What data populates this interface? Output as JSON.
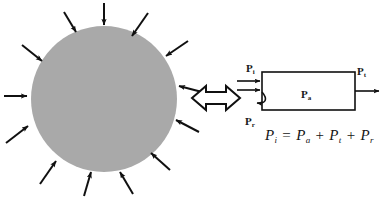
{
  "figure": {
    "background_color": "#ffffff",
    "width": 387,
    "height": 202
  },
  "left_panel": {
    "name": "incident-flux-on-body",
    "body": {
      "shape": "circle",
      "fill_color": "#a9a9a9",
      "center_x": 104,
      "center_y": 99,
      "radius": 73
    },
    "arrow_color": "#101010",
    "arrow_count": 12,
    "arrow_direction": "inward",
    "arrow_angles_deg": [
      90,
      62,
      34,
      10,
      180,
      203,
      230,
      258,
      285,
      310,
      337,
      155
    ]
  },
  "equivalence": {
    "name": "equivalence-arrow",
    "symbol": "⟺",
    "style": "hollow-double-headed",
    "color": "#101010"
  },
  "right_panel": {
    "name": "power-balance-box-model",
    "box": {
      "x": 262,
      "y": 72,
      "width": 93,
      "height": 38,
      "stroke_color": "#101010",
      "fill_color": "#ffffff"
    },
    "labels": {
      "incident": {
        "base": "P",
        "sub": "i"
      },
      "absorbed": {
        "base": "P",
        "sub": "a"
      },
      "transmitted": {
        "base": "P",
        "sub": "t"
      },
      "reflected": {
        "base": "P",
        "sub": "r"
      }
    },
    "equation": {
      "lhs": {
        "base": "P",
        "sub": "i"
      },
      "equals": "=",
      "terms": [
        {
          "base": "P",
          "sub": "a"
        },
        {
          "base": "P",
          "sub": "t"
        },
        {
          "base": "P",
          "sub": "r"
        }
      ],
      "plus": "+",
      "plain_text": "P_i = P_a + P_t + P_r"
    }
  }
}
